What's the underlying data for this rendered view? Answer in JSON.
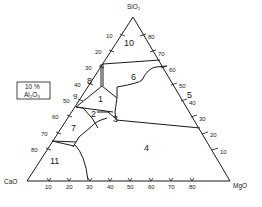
{
  "diagram": {
    "vertices": {
      "top": "SiO₂",
      "left": "CaO",
      "right": "MgO"
    },
    "condition_box": {
      "line1": "10 %",
      "line2": "Al₂O₃"
    },
    "left_ticks": [
      "10",
      "20",
      "30",
      "40",
      "50",
      "60",
      "70",
      "80"
    ],
    "right_ticks": [
      "80",
      "70",
      "60",
      "50",
      "40",
      "30",
      "20",
      "10"
    ],
    "bottom_ticks": [
      "10",
      "20",
      "30",
      "40",
      "50",
      "60",
      "70",
      "80"
    ],
    "fields": [
      {
        "id": "1",
        "label": "1"
      },
      {
        "id": "2",
        "label": "2"
      },
      {
        "id": "3",
        "label": "3"
      },
      {
        "id": "4",
        "label": "4"
      },
      {
        "id": "5",
        "label": "5"
      },
      {
        "id": "6",
        "label": "6"
      },
      {
        "id": "7",
        "label": "7"
      },
      {
        "id": "8",
        "label": "8"
      },
      {
        "id": "9",
        "label": "9"
      },
      {
        "id": "10",
        "label": "10"
      },
      {
        "id": "11",
        "label": "11"
      }
    ],
    "colors": {
      "line": "#1a1a1a",
      "background": "#ffffff"
    }
  }
}
